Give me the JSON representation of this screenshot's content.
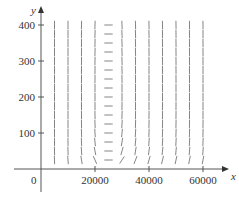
{
  "chart_data": {
    "type": "direction-field",
    "title": "",
    "xlabel": "x",
    "ylabel": "y",
    "origin_label": "0",
    "xlim": [
      0,
      65000
    ],
    "ylim": [
      0,
      430
    ],
    "x_ticks": [
      20000,
      40000,
      60000
    ],
    "x_tick_labels": [
      "20000",
      "40000",
      "60000"
    ],
    "y_ticks": [
      100,
      200,
      300,
      400
    ],
    "y_tick_labels": [
      "100",
      "200",
      "300",
      "400"
    ],
    "grid": false,
    "field": {
      "x_values": [
        5000,
        10000,
        15000,
        20000,
        25000,
        30000,
        35000,
        40000,
        45000,
        50000,
        55000,
        60000
      ],
      "y_values": [
        25,
        50,
        75,
        100,
        125,
        150,
        175,
        200,
        225,
        250,
        275,
        300,
        325,
        350,
        375,
        400
      ],
      "equilibrium": [
        25000,
        200
      ],
      "rotation": "counterclockwise",
      "description": "Predator-prey (Lotka-Volterra) slope field with closed orbits around the equilibrium point"
    }
  },
  "colors": {
    "axis": "#555555",
    "segment": "#777777",
    "text": "#333333"
  }
}
